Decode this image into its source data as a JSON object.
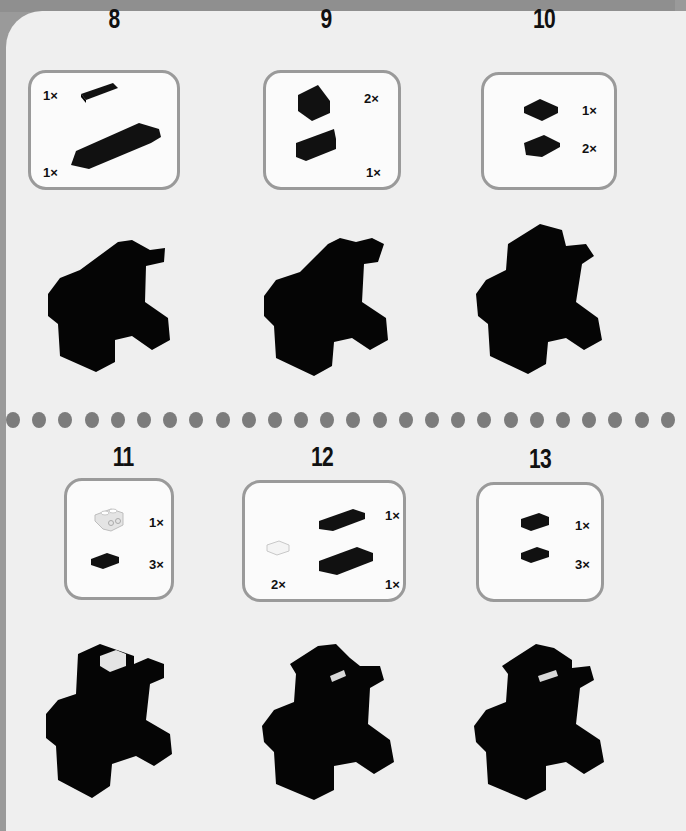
{
  "page": {
    "background_color": "#efefef",
    "frame_color": "#9a9a9a",
    "divider_dot_color": "#7c7c7c",
    "divider_dot_count": 26
  },
  "steps": [
    {
      "number": "8",
      "parts": [
        {
          "name": "black 1x4 plate",
          "color": "#111111",
          "qty": "1×"
        },
        {
          "name": "black 2x8 plate assembly",
          "color": "#111111",
          "qty": "1×"
        }
      ]
    },
    {
      "number": "9",
      "parts": [
        {
          "name": "black slope brick",
          "color": "#111111",
          "qty": "2×"
        },
        {
          "name": "black 1x3 brick",
          "color": "#111111",
          "qty": "1×"
        }
      ]
    },
    {
      "number": "10",
      "parts": [
        {
          "name": "black 2x2 plate",
          "color": "#111111",
          "qty": "1×"
        },
        {
          "name": "black 2x2 wedge plate",
          "color": "#111111",
          "qty": "2×"
        }
      ]
    },
    {
      "number": "11",
      "parts": [
        {
          "name": "white bracket 1x2-1x2",
          "color": "#e6e6e6",
          "qty": "1×"
        },
        {
          "name": "black 1x2 plate",
          "color": "#111111",
          "qty": "3×"
        }
      ]
    },
    {
      "number": "12",
      "parts": [
        {
          "name": "black 1x4 plate",
          "color": "#111111",
          "qty": "1×"
        },
        {
          "name": "white 1x1 tile",
          "color": "#e6e6e6",
          "qty": "2×"
        },
        {
          "name": "black 2x4 plate",
          "color": "#111111",
          "qty": "1×"
        }
      ]
    },
    {
      "number": "13",
      "parts": [
        {
          "name": "black 1x2 tile",
          "color": "#111111",
          "qty": "1×"
        },
        {
          "name": "black 1x2 plate",
          "color": "#111111",
          "qty": "3×"
        }
      ]
    }
  ]
}
